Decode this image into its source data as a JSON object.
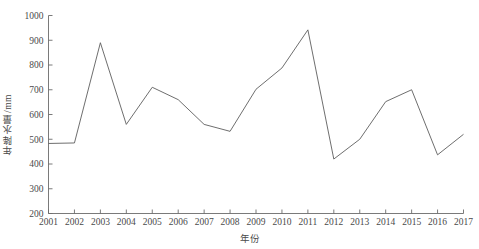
{
  "chart_data": {
    "type": "line",
    "title": "",
    "xlabel": "年份",
    "ylabel": "年降水量/mm",
    "grid": false,
    "legend": "none",
    "xlim": [
      2001,
      2017
    ],
    "ylim": [
      200,
      1000
    ],
    "y_ticks": [
      200,
      300,
      400,
      500,
      600,
      700,
      800,
      900,
      1000
    ],
    "categories": [
      2001,
      2002,
      2003,
      2004,
      2005,
      2006,
      2007,
      2008,
      2009,
      2010,
      2011,
      2012,
      2013,
      2014,
      2015,
      2016,
      2017
    ],
    "x_tick_labels": [
      "2001",
      "2002",
      "2003",
      "2004",
      "2005",
      "2006",
      "2007",
      "2008",
      "2009",
      "2010",
      "2011",
      "2012",
      "2013",
      "2014",
      "2015",
      "2016",
      "2017"
    ],
    "y_tick_labels": [
      "1000",
      "900",
      "800",
      "700",
      "600",
      "500",
      "400",
      "300",
      "200"
    ],
    "series": [
      {
        "name": "年降水量",
        "values": [
          483,
          485,
          890,
          560,
          710,
          660,
          560,
          532,
          702,
          788,
          942,
          420,
          500,
          652,
          700,
          437,
          520
        ]
      }
    ],
    "line_color": "#5e5e5e",
    "axis_color": "#6b6b6b",
    "background_color": "#ffffff"
  }
}
